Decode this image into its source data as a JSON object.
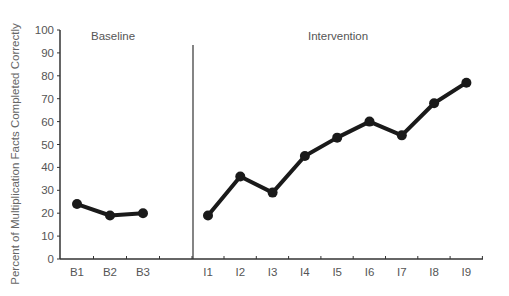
{
  "chart_data": {
    "type": "line",
    "title": "",
    "xlabel": "",
    "ylabel": "Percent of Multiplication Facts Completed Correctly",
    "ylim": [
      0,
      100
    ],
    "yticks": [
      0,
      10,
      20,
      30,
      40,
      50,
      60,
      70,
      80,
      90,
      100
    ],
    "grid": false,
    "legend": null,
    "phases": [
      {
        "name": "Baseline",
        "categories": [
          "B1",
          "B2",
          "B3"
        ],
        "values": [
          24,
          19,
          20
        ]
      },
      {
        "name": "Intervention",
        "categories": [
          "I1",
          "I2",
          "I3",
          "I4",
          "I5",
          "I6",
          "I7",
          "I8",
          "I9"
        ],
        "values": [
          19,
          36,
          29,
          45,
          53,
          60,
          54,
          68,
          77
        ]
      }
    ],
    "categories": [
      "B1",
      "B2",
      "B3",
      "I1",
      "I2",
      "I3",
      "I4",
      "I5",
      "I6",
      "I7",
      "I8",
      "I9"
    ],
    "annotations": [
      "Baseline",
      "Intervention",
      "phase change line between B3 and I1"
    ],
    "colors": {
      "line": "#1a1a1a",
      "axis": "#333333",
      "text": "#555555"
    }
  },
  "labels": {
    "ylabel": "Percent of Multiplication Facts Completed Correctly",
    "baseline": "Baseline",
    "intervention": "Intervention"
  }
}
